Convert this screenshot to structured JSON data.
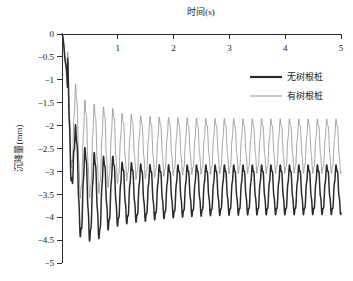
{
  "chart_data": {
    "type": "line",
    "title": "",
    "xlabel": "时间(s)",
    "ylabel": "沉降量(mm)",
    "xlim": [
      0,
      5
    ],
    "ylim": [
      -5,
      0
    ],
    "x_axis_position": "top",
    "grid": false,
    "xticks": [
      0,
      1,
      2,
      3,
      4,
      5
    ],
    "xtick_labels": [
      "0",
      "1",
      "2",
      "3",
      "4",
      "5"
    ],
    "yticks": [
      0,
      -0.5,
      -1,
      -1.5,
      -2,
      -2.5,
      -3,
      -3.5,
      -4,
      -4.5,
      -5
    ],
    "ytick_labels": [
      "0",
      "−0.5",
      "−1",
      "−1.5",
      "−2",
      "−2.5",
      "−3",
      "−3.5",
      "−4",
      "−4.5",
      "−5"
    ],
    "legend_position": "upper right",
    "oscillation_frequency_hz": 6,
    "series": [
      {
        "name": "无树根桩",
        "color": "#2a2a2a",
        "linewidth": 1.5,
        "steady_center": -3.4,
        "steady_peak": -2.9,
        "steady_trough": -3.9,
        "transient_min": -4.5,
        "x": [
          0,
          0.02,
          0.05,
          0.08,
          0.11,
          0.14,
          0.17,
          0.2,
          0.25,
          0.3,
          0.35,
          0.42,
          0.5,
          0.58,
          0.67,
          0.75,
          0.83,
          0.92,
          1.0,
          1.25,
          1.5,
          2.0,
          2.5,
          3.0,
          3.5,
          4.0,
          4.5,
          5.0
        ],
        "y": [
          0,
          -0.55,
          -1.05,
          -0.95,
          -1.35,
          -1.25,
          -1.6,
          -1.9,
          -2.6,
          -3.2,
          -3.75,
          -3.4,
          -4.2,
          -3.5,
          -4.5,
          -3.55,
          -4.0,
          -3.3,
          -3.95,
          -3.9,
          -4.1,
          -4.05,
          -3.95,
          -3.9,
          -3.88,
          -3.88,
          -3.87,
          -3.5
        ]
      },
      {
        "name": "有树根桩",
        "color": "#8d8d8d",
        "linewidth": 0.8,
        "steady_center": -2.45,
        "steady_peak": -1.9,
        "steady_trough": -3.0,
        "transient_min": -3.1,
        "x": [
          0,
          0.02,
          0.05,
          0.08,
          0.11,
          0.14,
          0.17,
          0.2,
          0.25,
          0.3,
          0.35,
          0.42,
          0.5,
          0.58,
          0.67,
          0.75,
          0.83,
          0.92,
          1.0,
          1.25,
          1.5,
          2.0,
          2.5,
          3.0,
          3.5,
          4.0,
          4.5,
          5.0
        ],
        "y": [
          0,
          -0.5,
          -0.95,
          -1.1,
          -1.2,
          -1.15,
          -1.45,
          -1.6,
          -2.0,
          -2.45,
          -2.7,
          -2.5,
          -2.95,
          -2.5,
          -3.05,
          -2.4,
          -2.8,
          -2.25,
          -2.7,
          -2.6,
          -2.75,
          -2.6,
          -2.5,
          -2.45,
          -2.45,
          -2.44,
          -2.43,
          -2.38
        ]
      }
    ]
  },
  "legend": {
    "items": [
      {
        "label": "无树根桩"
      },
      {
        "label": "有树根桩"
      }
    ]
  }
}
